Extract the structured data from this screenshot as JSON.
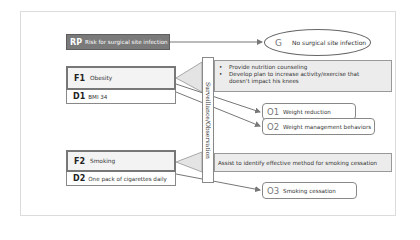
{
  "diagram": {
    "risk_problem": {
      "code": "RP",
      "label": "Risk for surgical site infection"
    },
    "goal": {
      "code": "G",
      "label": "No surgical site infection"
    },
    "surveillance_label": "Surveillance/Observation",
    "factors": [
      {
        "code": "F1",
        "label": "Obesity",
        "data": {
          "code": "D1",
          "label": "BMI 34"
        },
        "interventions": [
          "Provide nutrition counseling",
          "Develop plan to increase activity/exercise that doesn't impact his knees"
        ],
        "outcomes": [
          {
            "code": "O1",
            "label": "Weight reduction"
          },
          {
            "code": "O2",
            "label": "Weight management behaviors"
          }
        ]
      },
      {
        "code": "F2",
        "label": "Smoking",
        "data": {
          "code": "D2",
          "label": "One pack of cigarettes daily"
        },
        "interventions": [
          "Assist to identify effective method for smoking cessation"
        ],
        "outcomes": [
          {
            "code": "O3",
            "label": "Smoking cessation"
          }
        ]
      }
    ],
    "colors": {
      "rp_fill": "#7a7a7a",
      "intervention_fill": "#ececec",
      "factor_border": "#777777",
      "line": "#777777"
    }
  }
}
